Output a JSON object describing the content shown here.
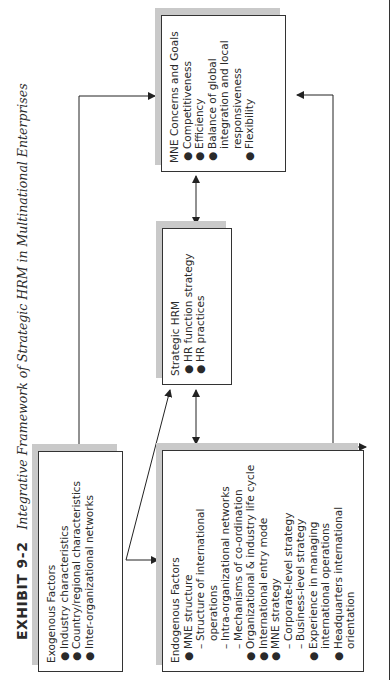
{
  "title": {
    "exhibit_number": "EXHIBIT 9-2",
    "caption": "Integrative Framework of Strategic HRM in Multinational Enterprises"
  },
  "boxes": {
    "exogenous": {
      "heading": "Exogenous Factors",
      "items": [
        "Industry characteristics",
        "Country/regional characteristics",
        "Inter-organizational networks"
      ]
    },
    "endogenous": {
      "heading": "Endogenous Factors",
      "items": [
        {
          "type": "bullet",
          "text": "MNE structure"
        },
        {
          "type": "sub",
          "text": "Structure of international operations"
        },
        {
          "type": "sub",
          "text": "Intra-organizational networks"
        },
        {
          "type": "sub",
          "text": "Mechanisms of co-ordination"
        },
        {
          "type": "bullet",
          "text": "Organizational & industry life cycle"
        },
        {
          "type": "bullet",
          "text": "International entry mode"
        },
        {
          "type": "bullet",
          "text": "MNE strategy"
        },
        {
          "type": "sub",
          "text": "Corporate-level strategy"
        },
        {
          "type": "sub",
          "text": "Business-level strategy"
        },
        {
          "type": "bullet",
          "text": "Experience in managing international operations"
        },
        {
          "type": "bullet",
          "text": "Headquarters international orientation"
        }
      ]
    },
    "strategic_hrm": {
      "heading": "Strategic HRM",
      "items": [
        "HR function strategy",
        "HR practices"
      ]
    },
    "mne_concerns": {
      "heading": "MNE Concerns and Goals",
      "items": [
        "Competitiveness",
        "Efficiency",
        "Balance of global integration and local responsiveness",
        "Flexibility"
      ]
    }
  },
  "connections": [
    {
      "from": "exogenous",
      "to": "mne_concerns",
      "type": "one-way"
    },
    {
      "from": "exogenous",
      "to": "endogenous",
      "type": "one-way"
    },
    {
      "from": "exogenous",
      "to": "strategic_hrm",
      "type": "one-way"
    },
    {
      "from": "endogenous",
      "to": "strategic_hrm",
      "type": "two-way"
    },
    {
      "from": "strategic_hrm",
      "to": "mne_concerns",
      "type": "two-way"
    },
    {
      "from": "endogenous",
      "to": "mne_concerns",
      "type": "two-way"
    }
  ],
  "colors": {
    "line": "#222222",
    "shadow": "#c9c9c9",
    "text": "#2a2a2a"
  }
}
